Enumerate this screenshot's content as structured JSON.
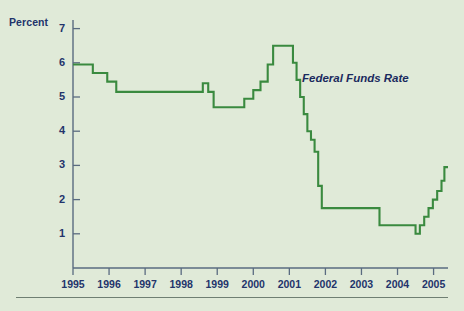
{
  "figure": {
    "background_color": "#e0ead8",
    "axis_color": "#5a6b80",
    "text_color": "#23346b",
    "line_color": "#3a8a3f"
  },
  "axis": {
    "y_axis_title": "Percent",
    "y_tick_labels": [
      "7",
      "6",
      "5",
      "4",
      "3",
      "2",
      "1"
    ],
    "x_tick_labels": [
      "1995",
      "1996",
      "1997",
      "1998",
      "1999",
      "2000",
      "2001",
      "2002",
      "2003",
      "2004",
      "2005"
    ]
  },
  "annotations": {
    "series_label": "Federal Funds Rate"
  },
  "chart_data": {
    "type": "line",
    "title": "",
    "subtitle": "",
    "xlabel": "",
    "ylabel": "Percent",
    "xlim": [
      1995.0,
      2005.4
    ],
    "ylim": [
      0,
      7
    ],
    "grid": false,
    "legend": "inline-annotation",
    "line_style": "step-post",
    "series": [
      {
        "name": "Federal Funds Rate",
        "color": "#3a8a3f",
        "x": [
          1995.0,
          1995.55,
          1995.95,
          1996.2,
          1996.3,
          1998.6,
          1998.75,
          1998.9,
          1999.45,
          1999.75,
          2000.0,
          2000.2,
          2000.4,
          2000.55,
          2001.0,
          2001.1,
          2001.2,
          2001.3,
          2001.4,
          2001.5,
          2001.6,
          2001.7,
          2001.8,
          2001.9,
          2002.95,
          2003.5,
          2004.5,
          2004.62,
          2004.74,
          2004.86,
          2004.98,
          2005.1,
          2005.22,
          2005.3
        ],
        "y": [
          5.95,
          5.7,
          5.45,
          5.15,
          5.15,
          5.4,
          5.15,
          4.7,
          4.7,
          4.95,
          5.2,
          5.45,
          5.95,
          6.5,
          6.5,
          6.0,
          5.5,
          5.0,
          4.5,
          4.0,
          3.75,
          3.4,
          2.4,
          1.75,
          1.75,
          1.25,
          1.0,
          1.25,
          1.5,
          1.75,
          2.0,
          2.25,
          2.55,
          2.95
        ],
        "notes": "Monthly step series; peak 6.5 in 2000-2001, trough 1.0 in 2003-2004, ending near 3.0 in 2005"
      }
    ]
  }
}
